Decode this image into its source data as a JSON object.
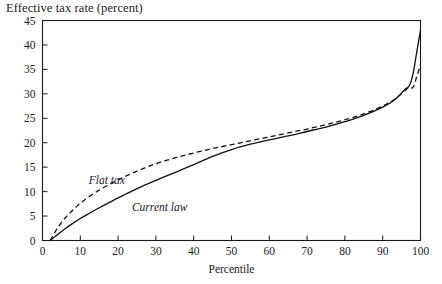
{
  "chart_data": {
    "type": "line",
    "title": "Effective tax rate (percent)",
    "xlabel": "Percentile",
    "ylabel": "",
    "xlim": [
      0,
      100
    ],
    "ylim": [
      0,
      45
    ],
    "grid": false,
    "legend_position": "inline-annotation",
    "x_ticks": [
      0,
      10,
      20,
      30,
      40,
      50,
      60,
      70,
      80,
      90,
      100
    ],
    "y_ticks": [
      0,
      5,
      10,
      15,
      20,
      25,
      30,
      35,
      40,
      45
    ],
    "annotations": [
      {
        "text": "Flat tax",
        "x": 17,
        "y": 11.6,
        "style": "italic"
      },
      {
        "text": "Current law",
        "x": 31,
        "y": 6.0,
        "style": "italic"
      }
    ],
    "series": [
      {
        "name": "Flat tax",
        "style": "dashed",
        "x": [
          2,
          4,
          6,
          8,
          10,
          12,
          15,
          18,
          20,
          25,
          30,
          35,
          40,
          45,
          50,
          55,
          60,
          65,
          70,
          75,
          80,
          85,
          90,
          93,
          95,
          96,
          97,
          98,
          99,
          100
        ],
        "values": [
          0,
          2.6,
          4.6,
          6.2,
          7.6,
          8.8,
          10.3,
          11.6,
          12.4,
          14.2,
          15.7,
          16.9,
          17.9,
          18.8,
          19.6,
          20.4,
          21.2,
          22.0,
          22.8,
          23.7,
          24.7,
          25.9,
          27.5,
          28.8,
          30.0,
          30.7,
          31.4,
          31.3,
          33.5,
          36.0
        ]
      },
      {
        "name": "Current law",
        "style": "solid",
        "x": [
          2,
          4,
          6,
          8,
          10,
          12,
          15,
          18,
          20,
          25,
          30,
          35,
          40,
          45,
          50,
          55,
          60,
          65,
          70,
          75,
          80,
          85,
          90,
          93,
          95,
          96,
          97,
          98,
          99,
          100
        ],
        "values": [
          0,
          1.2,
          2.4,
          3.5,
          4.5,
          5.4,
          6.7,
          7.9,
          8.7,
          10.6,
          12.3,
          13.9,
          15.5,
          17.2,
          18.6,
          19.7,
          20.6,
          21.4,
          22.3,
          23.2,
          24.3,
          25.6,
          27.3,
          28.7,
          30.2,
          31.0,
          31.6,
          34.0,
          38.5,
          43.0
        ]
      }
    ]
  }
}
